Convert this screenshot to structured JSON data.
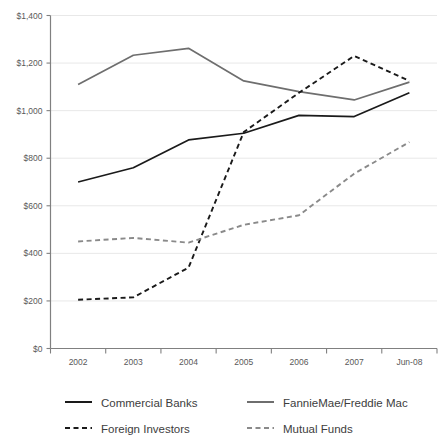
{
  "chart_data": {
    "type": "line",
    "title": "",
    "xlabel": "",
    "ylabel": "",
    "categories": [
      "2002",
      "2003",
      "2004",
      "2005",
      "2006",
      "2007",
      "Jun-08"
    ],
    "ylim": [
      0,
      1400
    ],
    "ytick_values": [
      0,
      200,
      400,
      600,
      800,
      1000,
      1200,
      1400
    ],
    "ytick_labels": [
      "$0",
      "$200",
      "$400",
      "$600",
      "$800",
      "$1,000",
      "$1,200",
      "$1,400"
    ],
    "grid": true,
    "legend_position": "bottom",
    "value_unit": "billions of dollars",
    "series": [
      {
        "name": "Commercial Banks",
        "style": "solid",
        "color": "#1a1a1a",
        "values": [
          700,
          760,
          877,
          905,
          980,
          975,
          1075
        ]
      },
      {
        "name": "FannieMae/Freddie Mac",
        "style": "solid",
        "color": "#6e6e6e",
        "values": [
          1110,
          1233,
          1262,
          1125,
          1080,
          1045,
          1120
        ]
      },
      {
        "name": "Foreign Investors",
        "style": "dashed",
        "color": "#1a1a1a",
        "values": [
          205,
          215,
          340,
          910,
          1075,
          1230,
          1125
        ]
      },
      {
        "name": "Mutual Funds",
        "style": "dashed",
        "color": "#8a8a8a",
        "values": [
          450,
          465,
          445,
          520,
          560,
          735,
          868
        ]
      }
    ]
  },
  "legend": {
    "entries": [
      {
        "label": "Commercial Banks",
        "style": "solid",
        "color": "#1a1a1a"
      },
      {
        "label": "FannieMae/Freddie Mac",
        "style": "solid",
        "color": "#6e6e6e"
      },
      {
        "label": "Foreign Investors",
        "style": "dashed",
        "color": "#1a1a1a"
      },
      {
        "label": "Mutual Funds",
        "style": "dashed",
        "color": "#8a8a8a"
      }
    ]
  }
}
